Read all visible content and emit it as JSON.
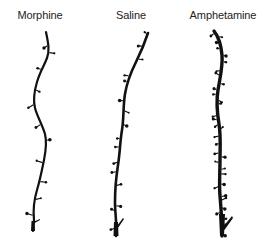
{
  "figure": {
    "panels": [
      {
        "label": "Morphine",
        "label_x": 40,
        "path": "M46,32 C48,42 50,50 47,58 C44,66 40,72 37,82 C34,92 33,100 35,108 C37,116 42,124 45,134 C47,142 46,150 44,160 C42,170 40,180 37,190 C34,200 33,210 34,220 L33,231",
        "width": 2.2
      },
      {
        "label": "Saline",
        "label_x": 131,
        "path": "M148,33 C145,42 141,52 136,62 C131,72 127,82 125,94 C123,106 124,118 122,130 C120,142 120,152 118,165 C116,178 115,190 115,202 C115,214 117,222 116,236",
        "width": 2.6
      },
      {
        "label": "Amphetamine",
        "label_x": 223,
        "path": "M214,31 C218,36 221,44 222,55 C223,66 220,78 218,90 C216,102 217,112 219,124 C221,136 220,148 220,160 C220,172 219,184 220,196 C221,208 222,218 222,236",
        "width": 3.4
      }
    ],
    "text_color": "#222222",
    "ink_color": "#111111"
  }
}
